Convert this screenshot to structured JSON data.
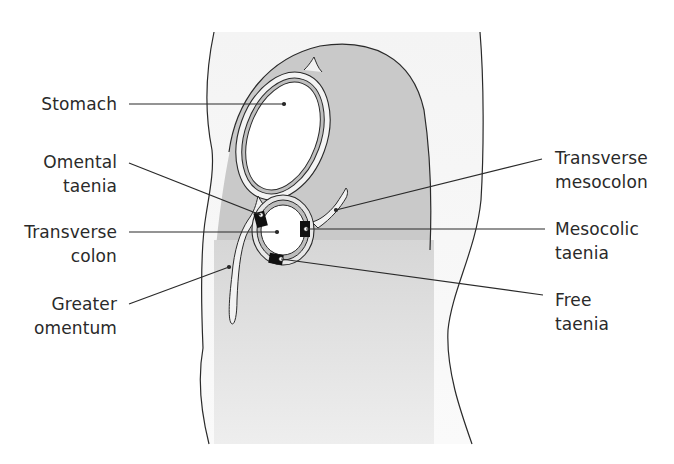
{
  "diagram": {
    "type": "anatomical cross-section",
    "colors": {
      "peritoneal_cavity_gray": "#c8c8c8",
      "body_wall_light": "#eeeeee",
      "taenia_black": "#111111",
      "line": "#2a2a2a",
      "background": "#ffffff"
    }
  },
  "labels": {
    "stomach": {
      "line1": "Stomach",
      "line2": ""
    },
    "omental_taenia": {
      "line1": "Omental",
      "line2": "taenia"
    },
    "transverse_colon": {
      "line1": "Transverse",
      "line2": "colon"
    },
    "greater_omentum": {
      "line1": "Greater",
      "line2": "omentum"
    },
    "transverse_mesocolon": {
      "line1": "Transverse",
      "line2": "mesocolon"
    },
    "mesocolic_taenia": {
      "line1": "Mesocolic",
      "line2": "taenia"
    },
    "free_taenia": {
      "line1": "Free",
      "line2": "taenia"
    }
  }
}
